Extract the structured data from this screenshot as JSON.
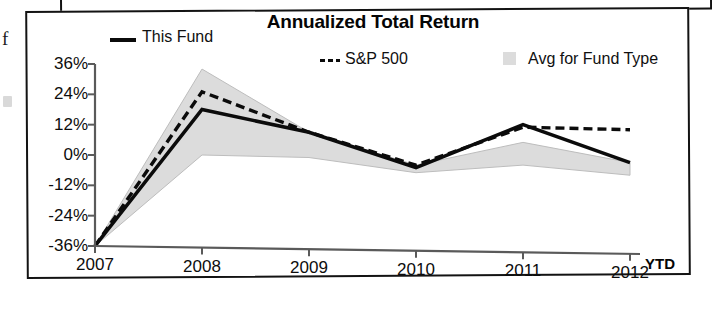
{
  "chart_data": {
    "type": "line",
    "title": "Annualized Total Return",
    "xlabel": "",
    "ylabel": "",
    "x": [
      "2007",
      "2008",
      "2009",
      "2010",
      "2011",
      "2012"
    ],
    "x_suffix_label": "YTD",
    "ylim": [
      -36,
      36
    ],
    "ytick_labels": [
      "36%",
      "24%",
      "12%",
      "0%",
      "-12%",
      "-24%",
      "-36%"
    ],
    "ytick_values": [
      36,
      24,
      12,
      0,
      -12,
      -24,
      -36
    ],
    "grid": false,
    "legend_position": "top",
    "series": [
      {
        "name": "This Fund",
        "style": "solid",
        "color": "#0b0b0b",
        "values": [
          -36,
          18,
          9,
          -5,
          12,
          -3
        ]
      },
      {
        "name": "S&P 500",
        "style": "dashed",
        "color": "#0b0b0b",
        "values": [
          -36,
          25,
          9,
          -4,
          11,
          10
        ]
      },
      {
        "name": "Avg for Fund Type",
        "style": "band",
        "color": "#dcdcdc",
        "upper": [
          -36,
          34,
          9,
          -4,
          5,
          -3
        ],
        "lower": [
          -36,
          0,
          -1,
          -7,
          -4,
          -8
        ]
      }
    ]
  },
  "legend": {
    "fund_label": "This Fund",
    "sp_label": "S&P 500",
    "avg_label": "Avg for Fund Type"
  },
  "page": {
    "margin_letter": "f"
  }
}
